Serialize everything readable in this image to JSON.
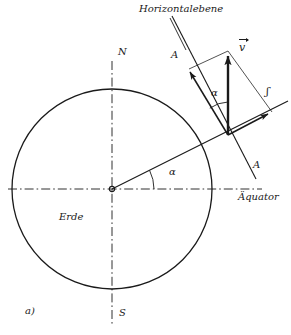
{
  "figure": {
    "caption": "a)",
    "language": "de",
    "title_label": "Horizontalebene",
    "body_label": "Erde",
    "equator_label": "Äquator",
    "pole_north": "N",
    "pole_south": "S",
    "section_label_top": "A",
    "section_label_bottom": "A",
    "angle_center": "α",
    "angle_vertex": "α",
    "vector_main": "v",
    "vector_component": "ʃ",
    "stroke_color": "#1a1a1a",
    "background_color": "#ffffff"
  },
  "geometry": {
    "circle": {
      "cx": 112,
      "cy": 189,
      "r": 100,
      "label": "Erde"
    },
    "center_marker": {
      "cx": 112,
      "cy": 189,
      "r": 2.6
    },
    "axis_horizontal": {
      "x1": 8,
      "y1": 189,
      "x2": 262,
      "y2": 189,
      "style": "dash-dot"
    },
    "axis_vertical": {
      "x1": 112,
      "y1": 62,
      "x2": 112,
      "y2": 324,
      "style": "dash-dot"
    },
    "equator_ray": {
      "x1": 112,
      "y1": 189,
      "x2": 288,
      "y2": 101,
      "angle_deg": 26.5
    },
    "section_line_AA": {
      "x1": 172,
      "y1": 16,
      "x2": 255,
      "y2": 178
    },
    "horizontal_plane_arrow": {
      "x1": 228,
      "y1": 135,
      "x2": 188,
      "y2": 70
    },
    "velocity_vector": {
      "x1": 228,
      "y1": 135,
      "x2": 228,
      "y2": 52
    },
    "component_arrow": {
      "x1": 228,
      "y1": 135,
      "x2": 271,
      "y2": 113
    },
    "parallelogram_side_a": {
      "x1": 188,
      "y1": 70,
      "x2": 228,
      "y2": 52
    },
    "parallelogram_side_b": {
      "x1": 228,
      "y1": 52,
      "x2": 271,
      "y2": 113
    },
    "angle_arc_center": {
      "cx": 112,
      "cy": 189,
      "r": 42,
      "start_deg": 0,
      "end_deg": 26.5
    },
    "angle_arc_vertex": {
      "cx": 228,
      "cy": 135,
      "r": 33,
      "start_deg": 90,
      "end_deg": 122
    }
  },
  "labels": [
    {
      "id": "horizontalebene",
      "text": "Horizontalebene",
      "x": 139,
      "y": 8,
      "size": "md"
    },
    {
      "id": "vector-v",
      "text": "v",
      "x": 239,
      "y": 47,
      "size": "lg"
    },
    {
      "id": "component-j",
      "text": "ʃ",
      "x": 266,
      "y": 92,
      "size": "lg"
    },
    {
      "id": "section-a-top",
      "text": "A",
      "x": 172,
      "y": 55,
      "size": "md"
    },
    {
      "id": "section-a-bottom",
      "text": "A",
      "x": 253,
      "y": 166,
      "size": "md"
    },
    {
      "id": "aequator",
      "text": "Äquator",
      "x": 240,
      "y": 195,
      "size": "md"
    },
    {
      "id": "alpha-vertex",
      "text": "α",
      "x": 211,
      "y": 94,
      "size": "md"
    },
    {
      "id": "alpha-center",
      "text": "α",
      "x": 169,
      "y": 172,
      "size": "md"
    },
    {
      "id": "pole-north",
      "text": "N",
      "x": 119,
      "y": 51,
      "size": "md"
    },
    {
      "id": "pole-south",
      "text": "S",
      "x": 119,
      "y": 312,
      "size": "md"
    },
    {
      "id": "erde",
      "text": "Erde",
      "x": 60,
      "y": 216,
      "size": "md"
    },
    {
      "id": "caption-a",
      "text": "a)",
      "x": 26,
      "y": 310,
      "size": "md"
    }
  ]
}
